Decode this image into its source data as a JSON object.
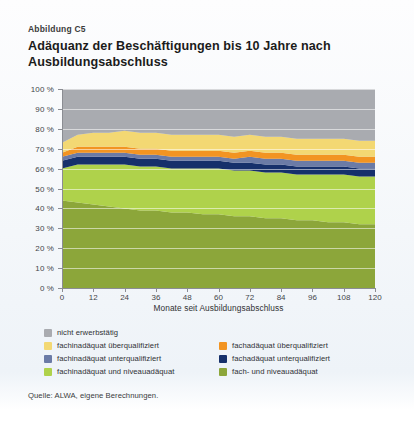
{
  "figure_number": "Abbildung C5",
  "title": "Adäquanz der Beschäftigungen bis 10 Jahre nach Ausbildungsabschluss",
  "source": "Quelle: ALWA, eigene Berechnungen.",
  "axes": {
    "x_title": "Monate seit Ausbildungsabschluss",
    "x_ticks": [
      "0",
      "12",
      "24",
      "36",
      "48",
      "60",
      "72",
      "84",
      "96",
      "108",
      "120"
    ],
    "y_ticks": [
      "0 %",
      "10 %",
      "20 %",
      "30 %",
      "40 %",
      "50 %",
      "60 %",
      "70 %",
      "80 %",
      "90 %",
      "100 %"
    ]
  },
  "legend": {
    "rows": [
      [
        {
          "label": "nicht erwerbstätig",
          "color": "#a9abb0"
        },
        null
      ],
      [
        {
          "label": "fachinadäquat überqualifiziert",
          "color": "#f3d873"
        },
        {
          "label": "fachadäquat überqualifiziert",
          "color": "#f29422"
        }
      ],
      [
        {
          "label": "fachinadäquat unterqualifiziert",
          "color": "#6b7ba6"
        },
        {
          "label": "fachadäquat unterqualifiziert",
          "color": "#16306b"
        }
      ],
      [
        {
          "label": "fachinadäquat und niveauadäquat",
          "color": "#afd24b"
        },
        {
          "label": "fach- und niveauadäquat",
          "color": "#8ca63a"
        }
      ]
    ]
  },
  "chart_data": {
    "type": "area",
    "title": "Adäquanz der Beschäftigungen bis 10 Jahre nach Ausbildungsabschluss",
    "xlabel": "Monate seit Ausbildungsabschluss",
    "ylabel": "",
    "xlim": [
      0,
      120
    ],
    "ylim": [
      0,
      100
    ],
    "grid": true,
    "stacked": true,
    "legend_position": "bottom",
    "x": [
      0,
      6,
      12,
      18,
      24,
      30,
      36,
      42,
      48,
      54,
      60,
      66,
      72,
      78,
      84,
      90,
      96,
      102,
      108,
      114,
      120
    ],
    "series": [
      {
        "name": "fach- und niveauadäquat",
        "color": "#8ca63a",
        "values": [
          44,
          43,
          42,
          41,
          40,
          39,
          39,
          38,
          38,
          37,
          37,
          36,
          36,
          35,
          35,
          34,
          34,
          33,
          33,
          32,
          32
        ]
      },
      {
        "name": "fachinadäquat und niveauadäquat",
        "color": "#afd24b",
        "values": [
          16,
          19,
          20,
          21,
          22,
          22,
          22,
          22,
          22,
          23,
          23,
          23,
          23,
          23,
          23,
          23,
          23,
          24,
          24,
          24,
          24
        ]
      },
      {
        "name": "fachadäquat unterqualifiziert",
        "color": "#16306b",
        "values": [
          4,
          4,
          4,
          4,
          4,
          4,
          4,
          4,
          4,
          4,
          4,
          4,
          4,
          4,
          4,
          4,
          4,
          4,
          4,
          4,
          4
        ]
      },
      {
        "name": "fachinadäquat unterqualifiziert",
        "color": "#6b7ba6",
        "values": [
          2,
          2,
          2,
          2,
          2,
          2,
          2,
          2,
          2,
          2,
          2,
          2,
          3,
          3,
          3,
          3,
          3,
          3,
          3,
          3,
          3
        ]
      },
      {
        "name": "fachadäquat überqualifiziert",
        "color": "#f29422",
        "values": [
          2,
          3,
          3,
          3,
          3,
          3,
          3,
          3,
          3,
          3,
          3,
          3,
          3,
          3,
          3,
          3,
          3,
          3,
          3,
          3,
          3
        ]
      },
      {
        "name": "fachinadäquat überqualifiziert",
        "color": "#f3d873",
        "values": [
          5,
          6,
          7,
          7,
          8,
          8,
          8,
          8,
          8,
          8,
          8,
          8,
          8,
          8,
          8,
          8,
          8,
          8,
          8,
          8,
          8
        ]
      },
      {
        "name": "nicht erwerbstätig",
        "color": "#a9abb0",
        "values": [
          27,
          23,
          22,
          22,
          21,
          22,
          22,
          23,
          23,
          23,
          23,
          24,
          23,
          24,
          24,
          25,
          25,
          25,
          25,
          26,
          26
        ]
      }
    ]
  }
}
